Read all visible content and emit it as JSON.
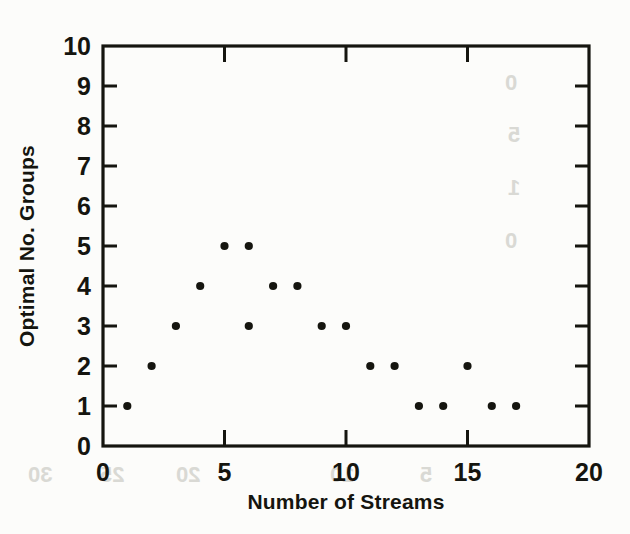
{
  "chart_data": {
    "type": "scatter",
    "title": "",
    "xlabel": "Number of Streams",
    "ylabel": "Optimal No. Groups",
    "xlim": [
      0,
      20
    ],
    "ylim": [
      0,
      10
    ],
    "xticks": [
      0,
      5,
      10,
      15,
      20
    ],
    "xtick_labels": [
      "0",
      "5",
      "10",
      "15",
      "20"
    ],
    "yticks": [
      0,
      1,
      2,
      3,
      4,
      5,
      6,
      7,
      8,
      9,
      10
    ],
    "ytick_labels": [
      "0",
      "1",
      "2",
      "3",
      "4",
      "5",
      "6",
      "7",
      "8",
      "9",
      "10"
    ],
    "x_minor_ticks": [
      1,
      2,
      3,
      4,
      6,
      7,
      8,
      9,
      11,
      12,
      13,
      14,
      16,
      17,
      18,
      19
    ],
    "grid": false,
    "legend": null,
    "marker": "filled-circle",
    "marker_color": "#15150f",
    "frame": "box-all-four-sides-ticks-inward",
    "points": [
      {
        "x": 1,
        "y": 1
      },
      {
        "x": 2,
        "y": 2
      },
      {
        "x": 3,
        "y": 3
      },
      {
        "x": 4,
        "y": 4
      },
      {
        "x": 5,
        "y": 5
      },
      {
        "x": 6,
        "y": 5
      },
      {
        "x": 6,
        "y": 3
      },
      {
        "x": 7,
        "y": 4
      },
      {
        "x": 8,
        "y": 4
      },
      {
        "x": 9,
        "y": 3
      },
      {
        "x": 10,
        "y": 3
      },
      {
        "x": 11,
        "y": 2
      },
      {
        "x": 12,
        "y": 2
      },
      {
        "x": 13,
        "y": 1
      },
      {
        "x": 14,
        "y": 1
      },
      {
        "x": 15,
        "y": 2
      },
      {
        "x": 16,
        "y": 1
      },
      {
        "x": 17,
        "y": 1
      }
    ],
    "x": [
      1,
      2,
      3,
      4,
      5,
      6,
      6,
      7,
      8,
      9,
      10,
      11,
      12,
      13,
      14,
      15,
      16,
      17
    ],
    "values": [
      1,
      2,
      3,
      4,
      5,
      5,
      3,
      4,
      4,
      3,
      3,
      2,
      2,
      1,
      1,
      2,
      1,
      1
    ]
  },
  "figure": {
    "background_color": "#fcfcfa",
    "ink_color": "#15150f",
    "bleed_artifacts": [
      "30",
      "25",
      "20",
      "15",
      "10",
      "5",
      "0"
    ]
  }
}
